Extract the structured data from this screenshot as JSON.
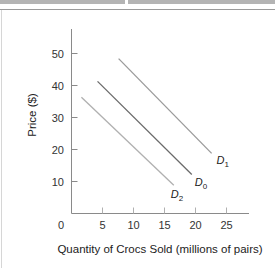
{
  "chart_data": {
    "type": "line",
    "title": "",
    "xlabel": "Quantity of Crocs Sold (millions of pairs)",
    "ylabel": "Price ($)",
    "xlim": [
      0,
      28
    ],
    "ylim": [
      0,
      57
    ],
    "x_ticks": [
      0,
      5,
      10,
      15,
      20,
      25
    ],
    "y_ticks": [
      10,
      20,
      30,
      40,
      50
    ],
    "x_tick_labels": [
      "0",
      "5",
      "10",
      "15",
      "20",
      "25"
    ],
    "y_tick_labels": [
      "10",
      "20",
      "30",
      "40",
      "50"
    ],
    "grid": false,
    "legend": "none (curves labeled directly at line ends)",
    "series": [
      {
        "name": "D1",
        "label_main": "D",
        "label_sub": "1",
        "color": "#9a9a9a",
        "points": [
          [
            7.6,
            48.4
          ],
          [
            22.6,
            18.8
          ]
        ]
      },
      {
        "name": "D0",
        "label_main": "D",
        "label_sub": "0",
        "color": "#6a6a6a",
        "points": [
          [
            4.2,
            41.3
          ],
          [
            19.4,
            12.2
          ]
        ]
      },
      {
        "name": "D2",
        "label_main": "D",
        "label_sub": "2",
        "color": "#b0b0b0",
        "points": [
          [
            1.6,
            36.3
          ],
          [
            16.5,
            8.8
          ]
        ]
      }
    ]
  },
  "axis": {
    "x_title": "Quantity of Crocs Sold (millions of pairs)",
    "y_title": "Price ($)",
    "origin_label": "0"
  }
}
